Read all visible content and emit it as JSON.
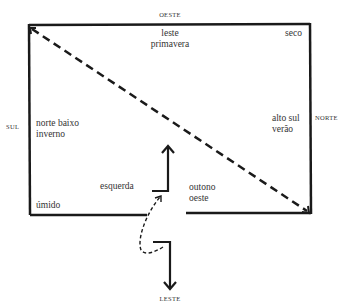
{
  "directions": {
    "top": "OESTE",
    "bottom": "LESTE",
    "left": "SUL",
    "right": "NORTE"
  },
  "regions": {
    "top_center": [
      "leste",
      "primavera"
    ],
    "top_right": "seco",
    "left_middle": [
      "norte baixo",
      "inverno"
    ],
    "right_middle": [
      "alto sul",
      "verão"
    ],
    "bottom_left": "úmido",
    "center_left": "esquerda",
    "center_right": [
      "outono",
      "oeste"
    ]
  },
  "colors": {
    "line": "#1a1a1a",
    "text": "#333333",
    "background": "#ffffff"
  }
}
